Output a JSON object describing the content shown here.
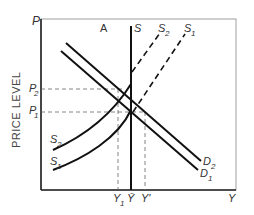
{
  "diagram": {
    "panel_label": "A",
    "y_axis_label": "PRICE LEVEL",
    "y_axis_symbol": "P",
    "x_axis_symbol": "Y",
    "price_levels": [
      {
        "label": "P",
        "sub": "2"
      },
      {
        "label": "P",
        "sub": "1"
      }
    ],
    "output_levels": [
      {
        "label": "Y",
        "sub": "1"
      },
      {
        "label": "Ȳ",
        "sub": ""
      },
      {
        "label": "Y'",
        "sub": ""
      }
    ],
    "curves": {
      "long_run_supply": "S",
      "supply_2_label": "S",
      "supply_2_sub": "2",
      "supply_1_label": "S",
      "supply_1_sub": "1",
      "demand_2_label": "D",
      "demand_2_sub": "2",
      "demand_1_label": "D",
      "demand_1_sub": "1"
    },
    "colors": {
      "line": "#111111",
      "dashed": "#555555",
      "frame": "#333333"
    }
  }
}
